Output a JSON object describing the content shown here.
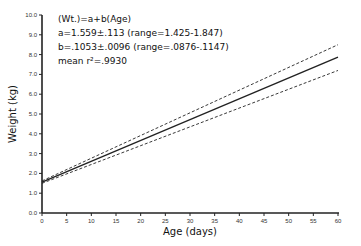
{
  "chart_data": {
    "type": "line",
    "title": "",
    "xlabel": "Age (days)",
    "ylabel": "Weight (kg)",
    "xlim": [
      0,
      60
    ],
    "ylim": [
      0,
      10
    ],
    "x_ticks": [
      "0",
      "5",
      "10",
      "15",
      "20",
      "25",
      "30",
      "35",
      "40",
      "45",
      "50",
      "55",
      "60"
    ],
    "y_ticks": [
      "0.0",
      "1.0",
      "2.0",
      "3.0",
      "4.0",
      "5.0",
      "6.0",
      "7.0",
      "8.0",
      "9.0",
      "10.0"
    ],
    "grid": false,
    "annotations": [
      "(Wt.)=a+b(Age)",
      "a=1.559±.113 (range=1.425-1.847)",
      "b=.1053±.0096 (range=.0876-.1147)",
      "mean r²=.9930"
    ],
    "series": [
      {
        "name": "mean regression",
        "style": "solid",
        "x": [
          0,
          60
        ],
        "values": [
          1.559,
          7.877
        ]
      },
      {
        "name": "upper bound",
        "style": "dashed",
        "x": [
          0,
          60
        ],
        "values": [
          1.62,
          8.5
        ]
      },
      {
        "name": "lower bound",
        "style": "dashed",
        "x": [
          0,
          60
        ],
        "values": [
          1.5,
          7.2
        ]
      }
    ]
  }
}
